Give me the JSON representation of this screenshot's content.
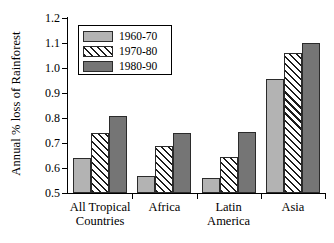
{
  "chart_data": {
    "type": "bar",
    "title": "",
    "xlabel": "",
    "ylabel": "Annual % loss of Rainforest",
    "ylim": [
      0.5,
      1.2
    ],
    "ytick_labels": [
      "0.5",
      "0.6",
      "0.7",
      "0.8",
      "0.9",
      "1.0",
      "1.1",
      "1.2"
    ],
    "ytick_values": [
      0.5,
      0.6,
      0.7,
      0.8,
      0.9,
      1.0,
      1.1,
      1.2
    ],
    "grid": false,
    "legend_position": "upper-left-inside",
    "categories": [
      "All Tropical\nCountries",
      "Africa",
      "Latin\nAmerica",
      "Asia"
    ],
    "category_labels_flat": [
      "All Tropical Countries",
      "Africa",
      "Latin America",
      "Asia"
    ],
    "series": [
      {
        "name": "1960-70",
        "values": [
          0.64,
          0.57,
          0.56,
          0.955
        ],
        "color": "#b3b3b3",
        "pattern": "solid"
      },
      {
        "name": "1970-80",
        "values": [
          0.74,
          0.69,
          0.645,
          1.06
        ],
        "color": "#ffffff",
        "pattern": "diagonal-hatch"
      },
      {
        "name": "1980-90",
        "values": [
          0.81,
          0.74,
          0.745,
          1.1
        ],
        "color": "#757575",
        "pattern": "solid"
      }
    ]
  },
  "legend": {
    "items": [
      {
        "label": "1960-70"
      },
      {
        "label": "1970-80"
      },
      {
        "label": "1980-90"
      }
    ]
  },
  "axis": {
    "y_title": "Annual % loss of Rainforest"
  }
}
